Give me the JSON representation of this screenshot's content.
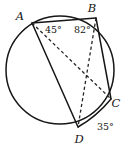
{
  "figure": {
    "kind": "circle-geometry-diagram",
    "background_color": "#ffffff",
    "stroke_color": "#161616",
    "dashed_stroke_color": "#262626",
    "width": 134,
    "height": 149
  },
  "circle": {
    "cx": 60,
    "cy": 70,
    "r": 54
  },
  "points": [
    {
      "id": "A",
      "label": "A",
      "x": 32,
      "y": 23,
      "label_x": 20,
      "label_y": 20
    },
    {
      "id": "B",
      "label": "B",
      "x": 96,
      "y": 18,
      "label_x": 92,
      "label_y": 12
    },
    {
      "id": "C",
      "label": "C",
      "x": 111,
      "y": 99,
      "label_x": 116,
      "label_y": 107
    },
    {
      "id": "D",
      "label": "D",
      "x": 78,
      "y": 127,
      "label_x": 79,
      "label_y": 143
    }
  ],
  "segments": [
    {
      "id": "AB",
      "from": "A",
      "to": "B",
      "style": "solid"
    },
    {
      "id": "AD",
      "from": "A",
      "to": "D",
      "style": "solid"
    },
    {
      "id": "BC",
      "from": "B",
      "to": "C",
      "style": "solid"
    },
    {
      "id": "CD",
      "from": "C",
      "to": "D",
      "style": "solid"
    },
    {
      "id": "AC",
      "from": "A",
      "to": "C",
      "style": "dashed"
    },
    {
      "id": "BD",
      "from": "B",
      "to": "D",
      "style": "dashed"
    }
  ],
  "angles": [
    {
      "id": "angle-at-A",
      "vertex": "A",
      "text": "45°",
      "x": 45,
      "y": 33
    },
    {
      "id": "angle-at-B",
      "vertex": "B",
      "text": "82°",
      "x": 74,
      "y": 33
    },
    {
      "id": "angle-at-C",
      "vertex": "C",
      "text": "35°",
      "x": 97,
      "y": 130
    }
  ],
  "paths": {
    "circle_d": "M 114,70 A 54,54 0 1,1 6,70 A 54,54 0 1,1 114,70 Z",
    "AB_d": "M 32,23 L 96,18",
    "AD_d": "M 32,23 L 78,127",
    "BC_d": "M 96,18 L 111,99",
    "CD_d": "M 111,99 Q 96,117 78,127",
    "AC_d": "M 32,23 L 111,99",
    "BD_d": "M 96,18 L 78,127"
  }
}
